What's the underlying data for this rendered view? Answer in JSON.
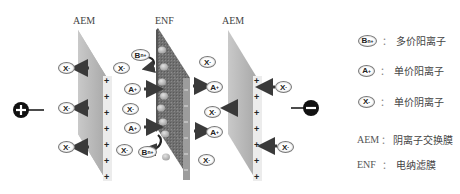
{
  "diagram": {
    "membranes": {
      "left_aem_label": "AEM",
      "enf_label": "ENF",
      "right_aem_label": "AEM"
    },
    "electrodes": {
      "anode": "+",
      "cathode": "−"
    },
    "ions": {
      "left_compartment": [
        "X⁻",
        "X⁻",
        "X⁻"
      ],
      "middle_left": [
        "Bⁿ⁺",
        "X⁻",
        "A⁺",
        "X⁻",
        "A⁺",
        "X⁻",
        "Bⁿ⁺"
      ],
      "middle_right": [
        "X⁻",
        "A⁺",
        "X⁻",
        "A⁺",
        "X⁻"
      ],
      "right_compartment": [
        "X⁻",
        "X⁻"
      ]
    },
    "ion_symbols": {
      "B": "B",
      "B_sup": "n+",
      "A": "A",
      "A_sup": "+",
      "X": "X",
      "X_sup": "-"
    }
  },
  "legend": {
    "items": [
      {
        "symbol": "B",
        "sup": "n+",
        "label": "多价阳离子"
      },
      {
        "symbol": "A",
        "sup": "+",
        "label": "单价阳离子"
      },
      {
        "symbol": "X",
        "sup": "-",
        "label": "单价阴离子"
      },
      {
        "abbr": "AEM",
        "label": "阴离子交换膜"
      },
      {
        "abbr": "ENF",
        "label": "电纳滤膜"
      }
    ],
    "separator": "："
  },
  "colors": {
    "aem_face": "#b8b8b8",
    "aem_edge": "#e6e6e6",
    "enf_face": "#6e6e6e",
    "enf_edge": "#9a9a9a",
    "arrow": "#3a3a3a",
    "electrode": "#111111"
  }
}
